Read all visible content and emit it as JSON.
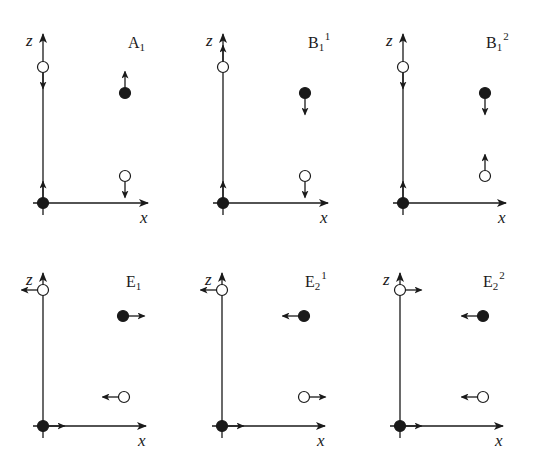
{
  "figure": {
    "axis_labels": {
      "x": "x",
      "z": "z"
    },
    "colors": {
      "ink": "#1a1a1a",
      "background": "#ffffff"
    },
    "panels": [
      {
        "id": "A1",
        "label_main": "A",
        "label_sub": "1",
        "label_sup": "",
        "origin": [
          43,
          203
        ],
        "z_top": 34,
        "x_right": 148,
        "atoms": [
          {
            "type": "open",
            "pos": [
              43,
              67
            ],
            "arrow": "down"
          },
          {
            "type": "filled",
            "pos": [
              125,
              93
            ],
            "arrow": "up"
          },
          {
            "type": "open",
            "pos": [
              125,
              176
            ],
            "arrow": "down"
          },
          {
            "type": "filled",
            "pos": [
              43,
              203
            ],
            "arrow": "up"
          }
        ]
      },
      {
        "id": "B1^1",
        "label_main": "B",
        "label_sub": "1",
        "label_sup": "1",
        "origin": [
          223,
          203
        ],
        "z_top": 34,
        "x_right": 328,
        "atoms": [
          {
            "type": "open",
            "pos": [
              223,
              67
            ],
            "arrow": "up"
          },
          {
            "type": "filled",
            "pos": [
              305,
              93
            ],
            "arrow": "down"
          },
          {
            "type": "open",
            "pos": [
              305,
              176
            ],
            "arrow": "down"
          },
          {
            "type": "filled",
            "pos": [
              223,
              203
            ],
            "arrow": "up"
          }
        ]
      },
      {
        "id": "B1^2",
        "label_main": "B",
        "label_sub": "1",
        "label_sup": "2",
        "origin": [
          403,
          203
        ],
        "z_top": 34,
        "x_right": 506,
        "atoms": [
          {
            "type": "open",
            "pos": [
              403,
              67
            ],
            "arrow": "down"
          },
          {
            "type": "filled",
            "pos": [
              485,
              93
            ],
            "arrow": "down"
          },
          {
            "type": "open",
            "pos": [
              485,
              176
            ],
            "arrow": "up"
          },
          {
            "type": "filled",
            "pos": [
              403,
              203
            ],
            "arrow": "up"
          }
        ]
      },
      {
        "id": "E1",
        "label_main": "E",
        "label_sub": "1",
        "label_sup": "",
        "origin": [
          43,
          426
        ],
        "z_top": 273,
        "x_right": 146,
        "atoms": [
          {
            "type": "open",
            "pos": [
              43,
              290
            ],
            "arrow": "left"
          },
          {
            "type": "filled",
            "pos": [
              123,
              316
            ],
            "arrow": "right"
          },
          {
            "type": "open",
            "pos": [
              124,
              397
            ],
            "arrow": "left"
          },
          {
            "type": "filled",
            "pos": [
              43,
              426
            ],
            "arrow": "right"
          }
        ]
      },
      {
        "id": "E2^1",
        "label_main": "E",
        "label_sub": "2",
        "label_sup": "1",
        "origin": [
          222,
          426
        ],
        "z_top": 273,
        "x_right": 325,
        "atoms": [
          {
            "type": "open",
            "pos": [
              222,
              290
            ],
            "arrow": "left"
          },
          {
            "type": "filled",
            "pos": [
              304,
              316
            ],
            "arrow": "left"
          },
          {
            "type": "open",
            "pos": [
              304,
              397
            ],
            "arrow": "right"
          },
          {
            "type": "filled",
            "pos": [
              222,
              426
            ],
            "arrow": "right"
          }
        ]
      },
      {
        "id": "E2^2",
        "label_main": "E",
        "label_sub": "2",
        "label_sup": "2",
        "origin": [
          400,
          426
        ],
        "z_top": 273,
        "x_right": 503,
        "atoms": [
          {
            "type": "open",
            "pos": [
              400,
              290
            ],
            "arrow": "right"
          },
          {
            "type": "filled",
            "pos": [
              483,
              316
            ],
            "arrow": "left"
          },
          {
            "type": "open",
            "pos": [
              483,
              397
            ],
            "arrow": "left"
          },
          {
            "type": "filled",
            "pos": [
              400,
              426
            ],
            "arrow": "right"
          }
        ]
      }
    ]
  }
}
